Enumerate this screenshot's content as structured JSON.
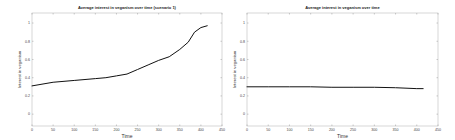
{
  "chart_data": [
    {
      "type": "line",
      "title": "Average interest in veganism over time (scenario 1)",
      "xlabel": "Time",
      "ylabel": "Interest in veganism",
      "xlim": [
        0,
        450
      ],
      "ylim": [
        -0.13,
        1.11
      ],
      "xticks": [
        0,
        50,
        100,
        150,
        200,
        250,
        300,
        350,
        400,
        450
      ],
      "yticks": [
        0,
        0.2,
        0.4,
        0.6,
        0.8,
        1
      ],
      "grid": false,
      "legend": null,
      "series": [
        {
          "name": "average interest",
          "color": "#111111",
          "x": [
            0,
            50,
            100,
            150,
            175,
            200,
            225,
            250,
            275,
            300,
            325,
            350,
            370,
            385,
            400,
            415
          ],
          "values": [
            0.31,
            0.35,
            0.37,
            0.39,
            0.4,
            0.42,
            0.44,
            0.49,
            0.54,
            0.59,
            0.63,
            0.71,
            0.79,
            0.9,
            0.95,
            0.97
          ]
        }
      ]
    },
    {
      "type": "line",
      "title": "Average interest in veganism over time",
      "xlabel": "Time",
      "ylabel": "Interest in veganism",
      "xlim": [
        0,
        450
      ],
      "ylim": [
        -0.13,
        1.11
      ],
      "xticks": [
        0,
        50,
        100,
        150,
        200,
        250,
        300,
        350,
        400,
        450
      ],
      "yticks": [
        0,
        0.2,
        0.4,
        0.6,
        0.8,
        1
      ],
      "grid": false,
      "legend": null,
      "series": [
        {
          "name": "average interest",
          "color": "#111111",
          "x": [
            0,
            50,
            100,
            150,
            200,
            250,
            300,
            350,
            400,
            415
          ],
          "values": [
            0.3,
            0.3,
            0.3,
            0.3,
            0.295,
            0.295,
            0.295,
            0.29,
            0.28,
            0.28
          ]
        }
      ]
    }
  ]
}
